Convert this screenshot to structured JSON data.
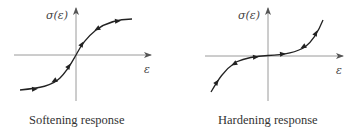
{
  "panels": [
    {
      "id": "softening",
      "caption": "Softening response",
      "y_axis_label": "σ(ε)",
      "x_axis_label": "ε",
      "curve_shape": "s-curve-saturating",
      "arrow_marker_count": 6
    },
    {
      "id": "hardening",
      "caption": "Hardening response",
      "y_axis_label": "σ(ε)",
      "x_axis_label": "ε",
      "curve_shape": "cubic-stiffening",
      "arrow_marker_count": 6
    }
  ],
  "colors": {
    "axis": "#9a9a9a",
    "curve": "#222222",
    "text": "#333333"
  }
}
